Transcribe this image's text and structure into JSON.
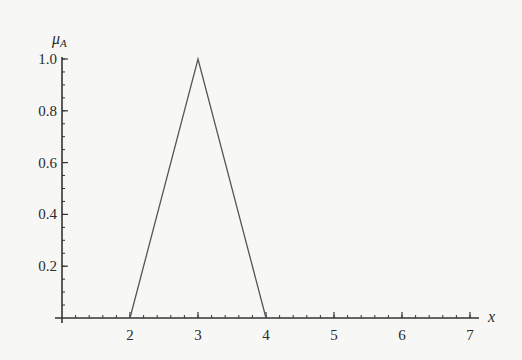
{
  "chart_data": {
    "type": "line",
    "title": "",
    "xlabel": "x",
    "ylabel": "μ_A",
    "ylabel_main": "μ",
    "ylabel_sub": "A",
    "xlim": [
      1,
      7.13
    ],
    "ylim": [
      0,
      1.0
    ],
    "x_ticks": [
      2,
      3,
      4,
      5,
      6,
      7
    ],
    "x_tick_labels": [
      "2",
      "3",
      "4",
      "5",
      "6",
      "7"
    ],
    "x_minor_step": 0.2,
    "y_ticks": [
      0.2,
      0.4,
      0.6,
      0.8,
      1.0
    ],
    "y_tick_labels": [
      "0.2",
      "0.4",
      "0.6",
      "0.8",
      "1.0"
    ],
    "y_minor_step": 0.05,
    "grid": false,
    "legend": null,
    "series": [
      {
        "name": "triangular membership function A",
        "x": [
          2,
          3,
          4
        ],
        "y": [
          0,
          1,
          0
        ],
        "color": "#555555"
      }
    ]
  }
}
